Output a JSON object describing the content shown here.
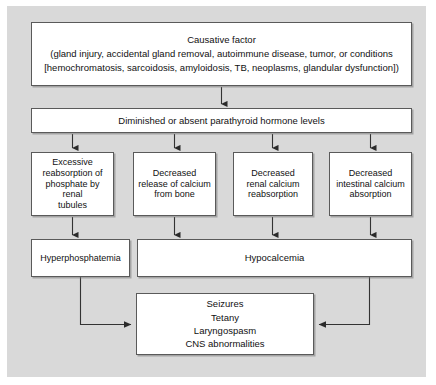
{
  "figure": {
    "type": "flowchart",
    "orientation": "top-down",
    "background_color": "#d9d9d9",
    "box_fill": "#ffffff",
    "box_border": "#5a5a5a",
    "line_color": "#333333"
  },
  "nodes": {
    "causative_factor": {
      "label": "Causative factor\n(gland injury, accidental gland removal, autoimmune disease, tumor, or conditions\n[hemochromatosis, sarcoidosis, amyloidosis, TB, neoplasms, glandular dysfunction])",
      "level": 1
    },
    "pth_levels": {
      "label": "Diminished or absent parathyroid hormone levels",
      "level": 2
    },
    "phosphate_reabsorption": {
      "label": "Excessive\nreabsorption of\nphosphate by renal\ntubules",
      "level": 3
    },
    "calcium_release_bone": {
      "label": "Decreased\nrelease of calcium\nfrom bone",
      "level": 3
    },
    "renal_calcium_reabsorption": {
      "label": "Decreased\nrenal calcium\nreabsorption",
      "level": 3
    },
    "intestinal_calcium_absorption": {
      "label": "Decreased\nintestinal calcium\nabsorption",
      "level": 3
    },
    "hyperphosphatemia": {
      "label": "Hyperphosphatemia",
      "level": 4
    },
    "hypocalcemia": {
      "label": "Hypocalcemia",
      "level": 4
    },
    "clinical_signs": {
      "label": "Seizures\nTetany\nLaryngospasm\nCNS abnormalities",
      "level": 5,
      "items": [
        "Seizures",
        "Tetany",
        "Laryngospasm",
        "CNS abnormalities"
      ]
    }
  },
  "edges": [
    {
      "from": "causative_factor",
      "to": "pth_levels",
      "style": "arrow-down"
    },
    {
      "from": "pth_levels",
      "to": "phosphate_reabsorption",
      "style": "arrow-down"
    },
    {
      "from": "pth_levels",
      "to": "calcium_release_bone",
      "style": "arrow-down"
    },
    {
      "from": "pth_levels",
      "to": "renal_calcium_reabsorption",
      "style": "arrow-down"
    },
    {
      "from": "pth_levels",
      "to": "intestinal_calcium_absorption",
      "style": "arrow-down"
    },
    {
      "from": "phosphate_reabsorption",
      "to": "hyperphosphatemia",
      "style": "arrow-down"
    },
    {
      "from": "calcium_release_bone",
      "to": "hypocalcemia",
      "style": "arrow-down"
    },
    {
      "from": "renal_calcium_reabsorption",
      "to": "hypocalcemia",
      "style": "arrow-down"
    },
    {
      "from": "intestinal_calcium_absorption",
      "to": "hypocalcemia",
      "style": "arrow-down"
    },
    {
      "from": "hyperphosphatemia",
      "to": "clinical_signs",
      "style": "elbow-right"
    },
    {
      "from": "hypocalcemia",
      "to": "clinical_signs",
      "style": "elbow-left"
    }
  ]
}
